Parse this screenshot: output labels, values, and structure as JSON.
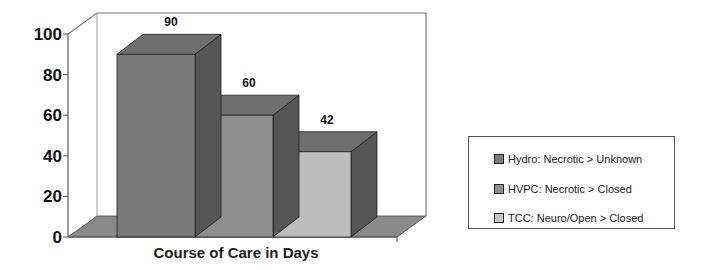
{
  "chart_data": {
    "type": "bar",
    "style": "3d-column",
    "title": "",
    "xlabel": "Course of Care in Days",
    "ylabel": "",
    "ylim": [
      0,
      100
    ],
    "yticks": [
      "0",
      "20",
      "40",
      "60",
      "80",
      "100"
    ],
    "grid": false,
    "legend_position": "right",
    "categories": [
      "Course of Care in Days"
    ],
    "series": [
      {
        "name": "Hydro: Necrotic > Unknown",
        "values": [
          90
        ],
        "label": "90",
        "color": "#7a7a7a"
      },
      {
        "name": "HVPC: Necrotic > Closed",
        "values": [
          60
        ],
        "label": "60",
        "color": "#8e8e8e"
      },
      {
        "name": "TCC: Neuro/Open > Closed",
        "values": [
          42
        ],
        "label": "42",
        "color": "#bdbdbd"
      }
    ]
  },
  "legend": {
    "items": [
      {
        "label": "Hydro: Necrotic > Unknown",
        "color": "#7a7a7a"
      },
      {
        "label": "HVPC: Necrotic > Closed",
        "color": "#8e8e8e"
      },
      {
        "label": "TCC: Neuro/Open > Closed",
        "color": "#c4c4c4"
      }
    ]
  }
}
